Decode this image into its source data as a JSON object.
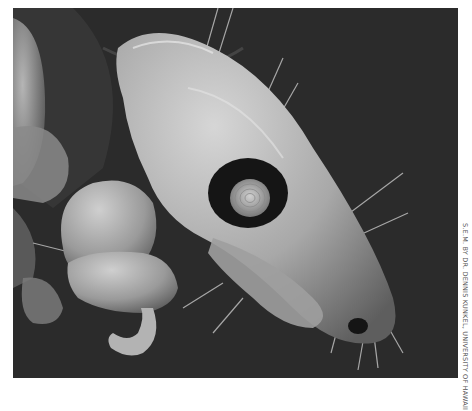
{
  "image": {
    "kind": "scanning electron micrograph",
    "subject": "arthropod head with eye, mouthparts and legs (SEM)",
    "colors": {
      "background": "#2b2b2b",
      "body_light": "#c8c8c8",
      "body_mid": "#8f8f8f",
      "shadow": "#1a1a1a",
      "page_margin": "#ffffff"
    }
  },
  "credit": {
    "text": "S.E.M. BY DR. DENNIS KUNKEL, UNIVERSITY OF HAWAII"
  }
}
